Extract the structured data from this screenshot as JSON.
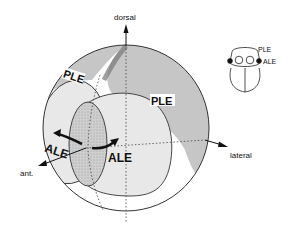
{
  "figure": {
    "axes": {
      "dorsal": "dorsal",
      "lateral": "lateral",
      "anterior": "ant."
    },
    "regions": {
      "ple_left": "PLE",
      "ple_right": "PLE",
      "ale_left": "ALE",
      "ale_right": "ALE"
    },
    "inset": {
      "ple": "PLE",
      "ale": "ALE"
    },
    "colors": {
      "ple_fill": "#c9c9c9",
      "ale_fill": "#e6e6e6",
      "overlap_fill": "#b5b5b5",
      "stroke": "#333333"
    }
  }
}
